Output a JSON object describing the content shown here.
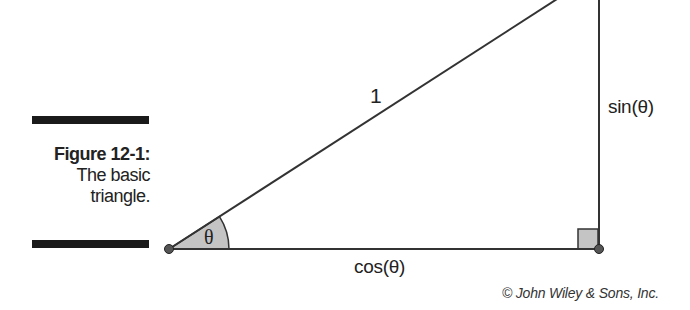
{
  "figure": {
    "number_label": "Figure 12-1:",
    "description_line1": "The basic",
    "description_line2": "triangle."
  },
  "diagram": {
    "hypotenuse_label": "1",
    "opposite_label": "sin(θ)",
    "adjacent_label": "cos(θ)",
    "angle_label": "θ",
    "line_color": "#333333",
    "fill_color": "#bdbdbd",
    "vertex_color": "#555555"
  },
  "credit": "© John Wiley & Sons, Inc."
}
